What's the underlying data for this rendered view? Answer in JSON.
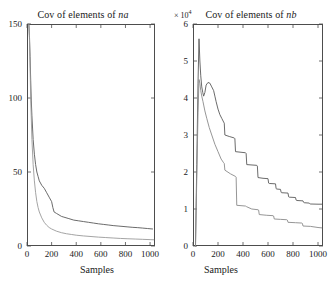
{
  "figure": {
    "background": "#ffffff",
    "axis_color": "#4d4d4d",
    "curve_color_a": "#5a5a5a",
    "curve_color_b": "#9a9a9a"
  },
  "panels": [
    {
      "id": "na",
      "title_prefix": "Cov of elements of ",
      "title_var": "na",
      "multiplier": "",
      "xlabel": "Samples",
      "yticks": [
        "0",
        "50",
        "100",
        "150"
      ],
      "xticks": [
        "0",
        "200",
        "400",
        "600",
        "800",
        "1000"
      ]
    },
    {
      "id": "nb",
      "title_prefix": "Cov of elements of ",
      "title_var": "nb",
      "multiplier_sym": "× 10",
      "multiplier_exp": "4",
      "xlabel": "Samples",
      "yticks": [
        "0",
        "1",
        "2",
        "3",
        "4",
        "5",
        "6"
      ],
      "xticks": [
        "0",
        "200",
        "400",
        "600",
        "800",
        "1000"
      ]
    }
  ],
  "chart_data": [
    {
      "type": "line",
      "id": "cov-na",
      "title": "Cov of elements of na",
      "xlabel": "Samples",
      "ylabel": "",
      "xlim": [
        0,
        1040
      ],
      "ylim": [
        0,
        150
      ],
      "xticks": [
        0,
        200,
        400,
        600,
        800,
        1000
      ],
      "yticks": [
        0,
        50,
        100,
        150
      ],
      "grid": false,
      "legend": "none",
      "series": [
        {
          "name": "upper curve",
          "color": "#5a5a5a",
          "x": [
            15,
            20,
            25,
            30,
            35,
            40,
            50,
            60,
            70,
            80,
            90,
            100,
            120,
            140,
            160,
            180,
            200,
            210,
            220,
            240,
            260,
            280,
            300,
            340,
            380,
            420,
            460,
            500,
            540,
            580,
            620,
            660,
            700,
            740,
            780,
            820,
            860,
            900,
            940,
            980,
            1020
          ],
          "values": [
            150,
            142,
            128,
            112,
            98,
            88,
            72,
            62,
            55,
            50,
            47,
            44,
            41,
            39,
            36,
            33,
            30,
            26,
            23,
            22,
            21,
            20,
            19.5,
            18.5,
            17.5,
            17,
            16.5,
            16,
            15.5,
            15,
            14.6,
            14.2,
            13.8,
            13.5,
            13.2,
            12.9,
            12.6,
            12.4,
            12.1,
            11.8,
            11.5
          ]
        },
        {
          "name": "lower curve",
          "color": "#9a9a9a",
          "x": [
            15,
            20,
            25,
            30,
            40,
            50,
            60,
            70,
            80,
            90,
            100,
            120,
            140,
            160,
            180,
            200,
            240,
            280,
            320,
            360,
            400,
            460,
            520,
            580,
            640,
            700,
            760,
            820,
            880,
            940,
            1000,
            1030
          ],
          "values": [
            150,
            140,
            120,
            100,
            72,
            55,
            44,
            36,
            30,
            26,
            23,
            19,
            16,
            14,
            12.5,
            11.5,
            10,
            9,
            8.3,
            7.8,
            7.3,
            6.8,
            6.4,
            6.0,
            5.7,
            5.4,
            5.1,
            4.9,
            4.7,
            4.5,
            4.3,
            4.2
          ]
        }
      ]
    },
    {
      "type": "line",
      "id": "cov-nb",
      "title": "Cov of elements of nb",
      "xlabel": "Samples",
      "ylabel": "",
      "y_multiplier": 10000,
      "y_multiplier_label": "× 10^4",
      "xlim": [
        0,
        1040
      ],
      "ylim": [
        0,
        60000
      ],
      "xticks": [
        0,
        200,
        400,
        600,
        800,
        1000
      ],
      "yticks": [
        0,
        10000,
        20000,
        30000,
        40000,
        50000,
        60000
      ],
      "grid": false,
      "legend": "none",
      "series": [
        {
          "name": "upper stepped curve",
          "color": "#5a5a5a",
          "x": [
            20,
            30,
            40,
            48,
            55,
            62,
            70,
            78,
            85,
            95,
            105,
            120,
            135,
            150,
            165,
            175,
            185,
            200,
            215,
            230,
            245,
            250,
            255,
            290,
            330,
            335,
            340,
            420,
            425,
            430,
            510,
            515,
            520,
            560,
            600,
            605,
            610,
            660,
            665,
            670,
            700,
            705,
            710,
            760,
            765,
            770,
            820,
            825,
            830,
            880,
            885,
            890,
            930,
            935,
            940,
            1000,
            1030
          ],
          "values": [
            0,
            22000,
            44000,
            56000,
            50000,
            46000,
            43000,
            41500,
            40500,
            41500,
            43500,
            44200,
            44000,
            43000,
            42000,
            40500,
            39000,
            37000,
            35500,
            34500,
            33500,
            33200,
            30000,
            29600,
            29200,
            29000,
            25500,
            25200,
            25000,
            22000,
            21800,
            21600,
            18500,
            18300,
            18200,
            17000,
            16900,
            16800,
            15500,
            15400,
            15300,
            14500,
            14400,
            14300,
            13300,
            13200,
            13100,
            12400,
            12300,
            12200,
            11800,
            11700,
            11600,
            11400,
            11350,
            11300,
            11300
          ]
        },
        {
          "name": "lower stepped curve",
          "color": "#8a8a8a",
          "x": [
            20,
            30,
            40,
            48,
            55,
            62,
            70,
            80,
            95,
            110,
            130,
            150,
            175,
            200,
            225,
            245,
            250,
            255,
            300,
            340,
            345,
            350,
            420,
            425,
            430,
            470,
            520,
            525,
            530,
            590,
            640,
            645,
            650,
            700,
            750,
            755,
            760,
            820,
            870,
            875,
            880,
            940,
            1000,
            1030
          ],
          "values": [
            0,
            18000,
            36000,
            45000,
            44000,
            42000,
            40500,
            39000,
            36500,
            34500,
            32000,
            30000,
            27500,
            25500,
            23500,
            22500,
            22300,
            20500,
            19500,
            18800,
            18600,
            11000,
            10800,
            10700,
            10600,
            10000,
            9800,
            9700,
            8500,
            8300,
            8200,
            8100,
            7300,
            7200,
            7100,
            7000,
            6400,
            6300,
            6200,
            6100,
            5400,
            5300,
            5000,
            4900
          ]
        }
      ]
    }
  ]
}
